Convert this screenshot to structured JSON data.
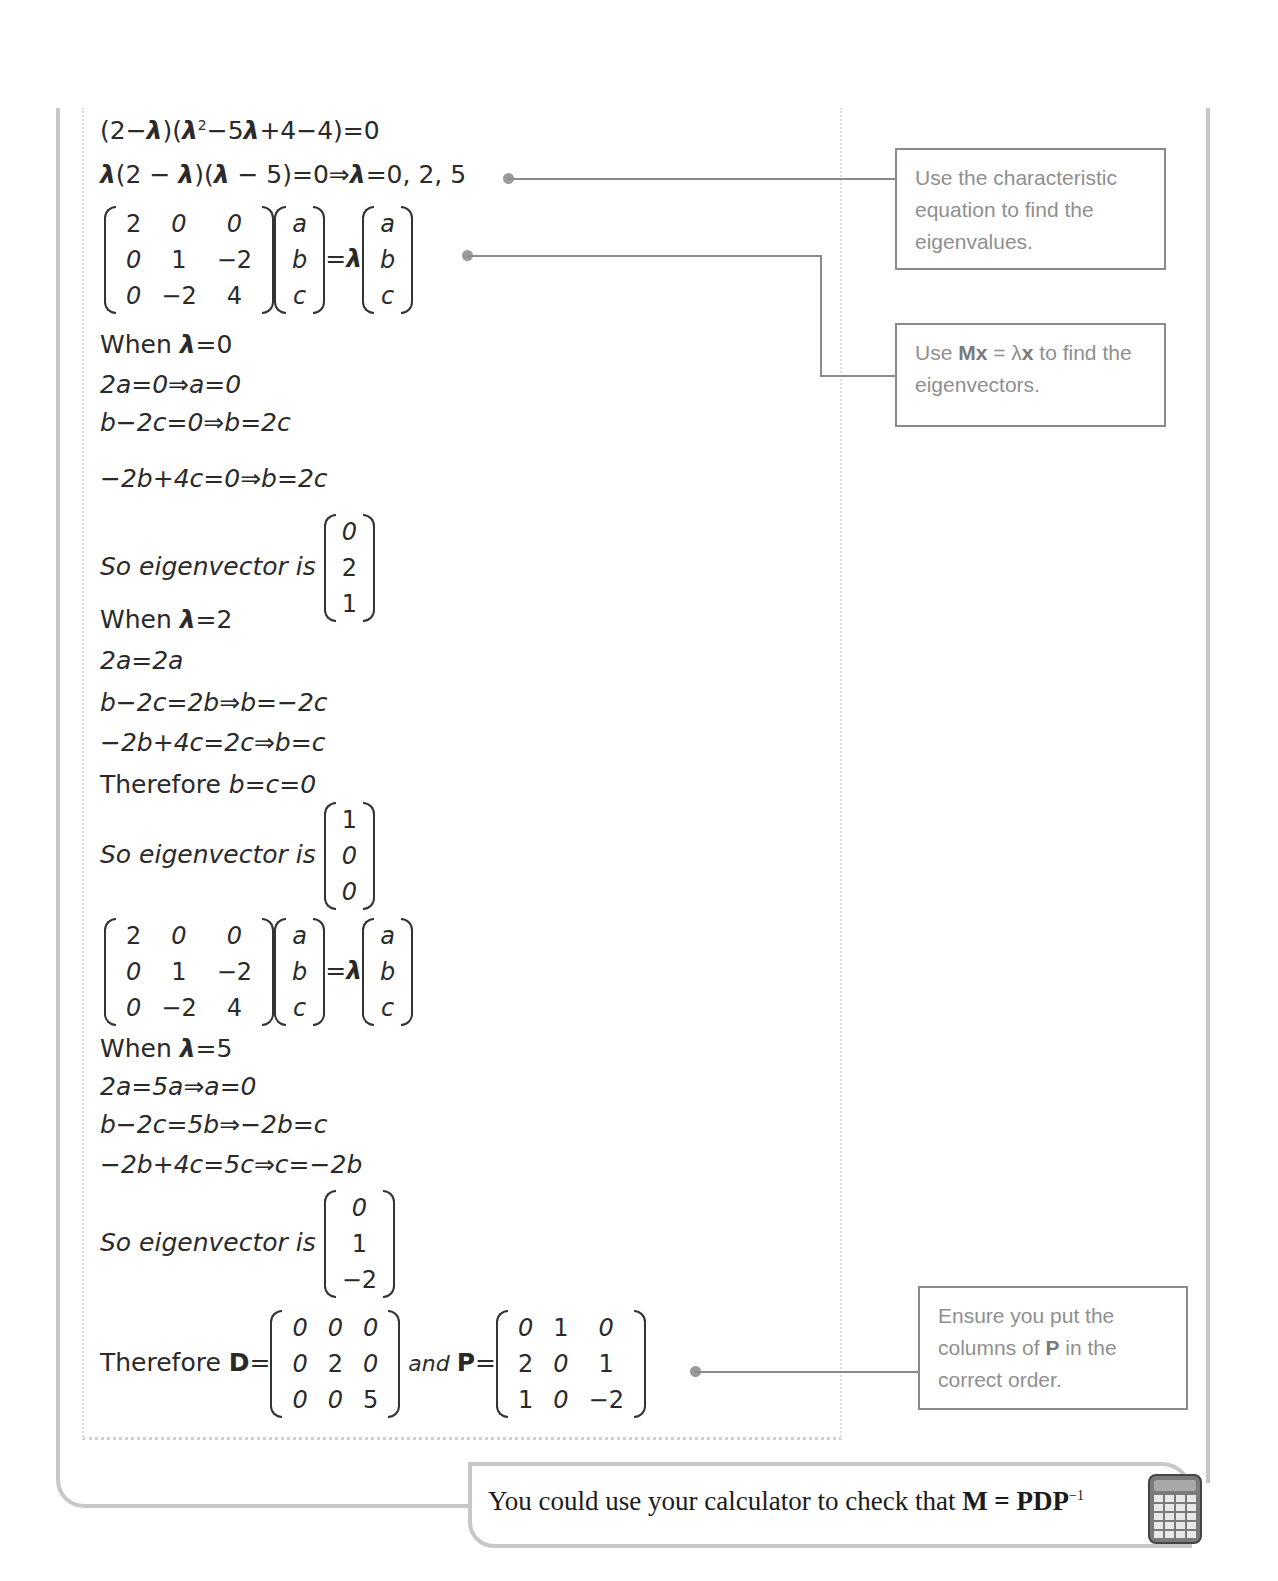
{
  "working": {
    "line1": {
      "pre": "(2−",
      "lam1": "λ",
      "mid1": ")(",
      "lam2": "λ",
      "sup": "2",
      "mid2": "−5",
      "lam3": "λ",
      "post": "+4−4)=0"
    },
    "line2": {
      "lam1": "λ",
      "a": "(2 − ",
      "lam2": "λ",
      "b": ")(",
      "lam3": "λ",
      "c": " − 5)=0⇒",
      "lam4": "λ",
      "d": "=0, 2, 5"
    },
    "matrix_eq": {
      "M": [
        [
          "2",
          "0",
          "0"
        ],
        [
          "0",
          "1",
          "−2"
        ],
        [
          "0",
          "−2",
          "4"
        ]
      ],
      "x": [
        "a",
        "b",
        "c"
      ],
      "eq": "=",
      "lambda": "λ"
    },
    "case0": {
      "when_label": "When ",
      "lambda": "λ",
      "when_value": "=0",
      "lines": [
        "2a=0⇒a=0",
        "b−2c=0⇒b=2c",
        "−2b+4c=0⇒b=2c"
      ],
      "so_label": "So eigenvector is",
      "vector": [
        "0",
        "2",
        "1"
      ]
    },
    "case2": {
      "when_label": "When ",
      "lambda": "λ",
      "when_value": "=2",
      "lines": [
        "2a=2a",
        "b−2c=2b⇒b=−2c",
        "−2b+4c=2c⇒b=c"
      ],
      "therefore_label": "Therefore ",
      "therefore_value": "b=c=0",
      "so_label": "So eigenvector is",
      "vector": [
        "1",
        "0",
        "0"
      ]
    },
    "case5": {
      "when_label": "When ",
      "lambda": "λ",
      "when_value": "=5",
      "lines": [
        "2a=5a⇒a=0",
        "b−2c=5b⇒−2b=c",
        "−2b+4c=5c⇒c=−2b"
      ],
      "so_label": "So eigenvector is",
      "vector": [
        "0",
        "1",
        "−2"
      ]
    },
    "conclusion": {
      "therefore_label": "Therefore ",
      "D_label": "D",
      "eq": "=",
      "D": [
        [
          "0",
          "0",
          "0"
        ],
        [
          "0",
          "2",
          "0"
        ],
        [
          "0",
          "0",
          "5"
        ]
      ],
      "and_label": "and ",
      "P_label": "P",
      "P": [
        [
          "0",
          "1",
          "0"
        ],
        [
          "2",
          "0",
          "1"
        ],
        [
          "1",
          "0",
          "−2"
        ]
      ]
    }
  },
  "callouts": {
    "eigenvalues": {
      "text": "Use the characteristic equation to find the eigenvalues."
    },
    "eigenvectors": {
      "pre": "Use ",
      "bold1": "Mx",
      "mid": " = λ",
      "bold2": "x",
      "post": " to find the eigenvectors."
    },
    "order": {
      "pre": "Ensure you put the columns of ",
      "bold": "P",
      "post": " in the correct order."
    }
  },
  "tip": {
    "pre": "You could use your calculator to check that ",
    "bold": "M = PDP",
    "sup": "−1",
    "icon": "calculator-icon"
  },
  "colors": {
    "frame": "#c8c8c8",
    "callout_border": "#8a8a8a",
    "callout_text": "#8f8f8f"
  }
}
